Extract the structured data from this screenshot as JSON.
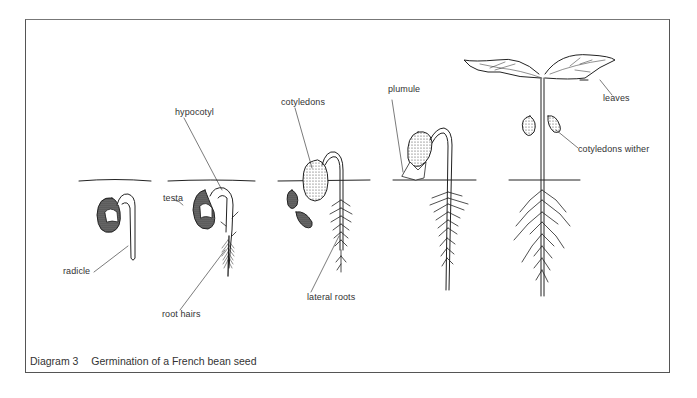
{
  "figure": {
    "caption_number": "Diagram 3",
    "caption_text": "Germination of a French bean seed"
  },
  "labels": {
    "hypocotyl": "hypocotyl",
    "cotyledons": "cotyledons",
    "plumule": "plumule",
    "leaves": "leaves",
    "cotyledons_wither": "cotyledons wither",
    "testa": "testa",
    "radicle": "radicle",
    "root_hairs": "root hairs",
    "lateral_roots": "lateral roots"
  },
  "stages": [
    {
      "index": 1,
      "description": "seed with emerging radicle"
    },
    {
      "index": 2,
      "description": "testa splitting, hypocotyl arching, root hairs"
    },
    {
      "index": 3,
      "description": "cotyledons emerging at soil surface, lateral roots, shed testa"
    },
    {
      "index": 4,
      "description": "plumule emerging above ground"
    },
    {
      "index": 5,
      "description": "seedling with leaves, cotyledons withering"
    }
  ],
  "colors": {
    "ink": "#222222",
    "frame": "#555555",
    "label": "#333333"
  }
}
